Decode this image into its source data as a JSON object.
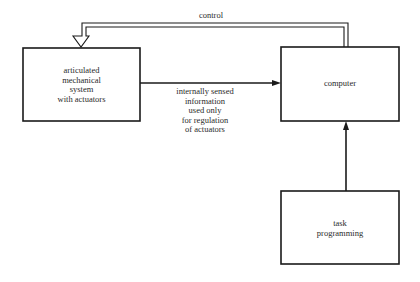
{
  "nodes": {
    "mechanical": {
      "lines": [
        "articulated",
        "mechanical",
        "system",
        "with actuators"
      ]
    },
    "computer": {
      "lines": [
        "computer"
      ]
    },
    "task": {
      "lines": [
        "task",
        "programming"
      ]
    }
  },
  "edges": {
    "control": {
      "label": "control",
      "from": "computer",
      "to": "mechanical",
      "style": "hollow-double"
    },
    "sensed": {
      "lines": [
        "internally sensed",
        "information",
        "used only",
        "for regulation",
        "of actuators"
      ],
      "from": "mechanical",
      "to": "computer"
    },
    "task_to_computer": {
      "from": "task",
      "to": "computer"
    }
  },
  "colors": {
    "line": "#1a1a1a",
    "background": "#ffffff"
  }
}
